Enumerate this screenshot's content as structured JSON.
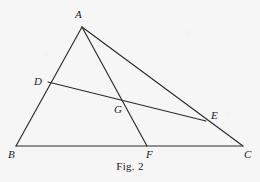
{
  "figure": {
    "caption": "Fig. 2",
    "background_color": "#f6f6f7",
    "stroke_color": "#2b2b2b",
    "label_color": "#1b1b1b",
    "width": 260,
    "height": 182,
    "points": {
      "A": {
        "label": "A",
        "x": 82,
        "y": 27,
        "label_x": 75,
        "label_y": 9
      },
      "B": {
        "label": "B",
        "x": 16,
        "y": 146,
        "label_x": 8,
        "label_y": 149
      },
      "C": {
        "label": "C",
        "x": 243,
        "y": 146,
        "label_x": 244,
        "label_y": 149
      },
      "D": {
        "label": "D",
        "x": 48,
        "y": 82,
        "label_x": 34,
        "label_y": 76
      },
      "E": {
        "label": "E",
        "x": 206,
        "y": 121,
        "label_x": 211,
        "label_y": 110
      },
      "F": {
        "label": "F",
        "x": 147,
        "y": 146,
        "label_x": 146,
        "label_y": 149
      },
      "G": {
        "label": "G",
        "x": 122,
        "y": 99,
        "label_x": 114,
        "label_y": 104
      }
    },
    "segments": [
      {
        "name": "segment-AB",
        "from": "A",
        "to": "B"
      },
      {
        "name": "segment-BC",
        "from": "B",
        "to": "C"
      },
      {
        "name": "segment-AC",
        "from": "A",
        "to": "C"
      },
      {
        "name": "segment-AF",
        "from": "A",
        "to": "F"
      },
      {
        "name": "segment-DE",
        "from": "D",
        "to": "E"
      }
    ]
  }
}
